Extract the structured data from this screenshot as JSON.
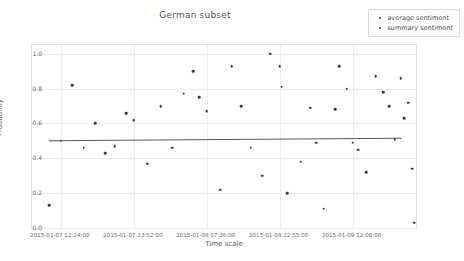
{
  "chart_data": {
    "type": "scatter",
    "title": "German subset",
    "xlabel": "Time scale",
    "ylabel": "Probability",
    "ylim": [
      0.0,
      1.05
    ],
    "grid": true,
    "legend_position": "top-right",
    "ytick_labels": [
      "0.0",
      "0.2",
      "0.4",
      "0.6",
      "0.8",
      "1.0"
    ],
    "ytick_values": [
      0.0,
      0.2,
      0.4,
      0.6,
      0.8,
      1.0
    ],
    "xtick_labels": [
      "2015-01-07 12:24:00",
      "2015-01-07 23:52:00",
      "2015-01-08 07:36:00",
      "2015-01-08 22:55:00",
      "2015-01-09 12:08:00"
    ],
    "xtick_positions": [
      0.075,
      0.265,
      0.455,
      0.645,
      0.835
    ],
    "series": [
      {
        "name": "average sentiment",
        "color": "#3a3a3a",
        "points": [
          {
            "x": 0.045,
            "y": 0.13
          },
          {
            "x": 0.075,
            "y": 0.5
          },
          {
            "x": 0.105,
            "y": 0.82
          },
          {
            "x": 0.135,
            "y": 0.46
          },
          {
            "x": 0.165,
            "y": 0.6
          },
          {
            "x": 0.19,
            "y": 0.43
          },
          {
            "x": 0.215,
            "y": 0.47
          },
          {
            "x": 0.245,
            "y": 0.66
          },
          {
            "x": 0.265,
            "y": 0.62
          },
          {
            "x": 0.3,
            "y": 0.37
          },
          {
            "x": 0.335,
            "y": 0.7
          },
          {
            "x": 0.365,
            "y": 0.46
          },
          {
            "x": 0.395,
            "y": 0.77
          },
          {
            "x": 0.42,
            "y": 0.9
          },
          {
            "x": 0.435,
            "y": 0.75
          },
          {
            "x": 0.455,
            "y": 0.67
          },
          {
            "x": 0.49,
            "y": 0.22
          },
          {
            "x": 0.52,
            "y": 0.93
          },
          {
            "x": 0.545,
            "y": 0.7
          },
          {
            "x": 0.57,
            "y": 0.46
          },
          {
            "x": 0.6,
            "y": 0.3
          },
          {
            "x": 0.62,
            "y": 1.0
          },
          {
            "x": 0.645,
            "y": 0.93
          },
          {
            "x": 0.65,
            "y": 0.81
          },
          {
            "x": 0.665,
            "y": 0.2
          },
          {
            "x": 0.7,
            "y": 0.38
          },
          {
            "x": 0.725,
            "y": 0.69
          },
          {
            "x": 0.74,
            "y": 0.49
          },
          {
            "x": 0.76,
            "y": 0.11
          },
          {
            "x": 0.79,
            "y": 0.68
          },
          {
            "x": 0.8,
            "y": 0.93
          },
          {
            "x": 0.82,
            "y": 0.8
          },
          {
            "x": 0.835,
            "y": 0.49
          },
          {
            "x": 0.85,
            "y": 0.45
          },
          {
            "x": 0.87,
            "y": 0.32
          },
          {
            "x": 0.895,
            "y": 0.87
          },
          {
            "x": 0.915,
            "y": 0.78
          },
          {
            "x": 0.93,
            "y": 0.7
          },
          {
            "x": 0.945,
            "y": 0.51
          },
          {
            "x": 0.96,
            "y": 0.86
          },
          {
            "x": 0.97,
            "y": 0.63
          },
          {
            "x": 0.98,
            "y": 0.72
          },
          {
            "x": 0.99,
            "y": 0.34
          },
          {
            "x": 0.995,
            "y": 0.03
          }
        ]
      },
      {
        "name": "summary sentiment",
        "color": "#3a3a3a",
        "points": []
      }
    ],
    "trend_line": {
      "x_start": 0.045,
      "x_end": 0.965,
      "y_start": 0.498,
      "y_end": 0.512
    }
  },
  "legend": {
    "items": [
      {
        "label": "average sentiment"
      },
      {
        "label": "summary sentiment"
      }
    ]
  },
  "caption": {
    "text": ""
  }
}
